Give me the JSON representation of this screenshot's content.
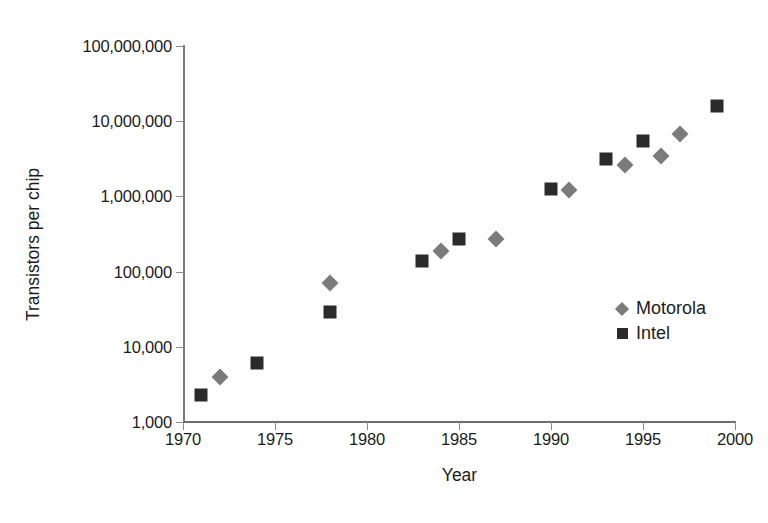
{
  "chart_data": {
    "type": "scatter",
    "title": "",
    "xlabel": "Year",
    "ylabel": "Transistors per chip",
    "xlim": [
      1970,
      2000
    ],
    "ylim": [
      1000,
      100000000
    ],
    "yscale": "log",
    "grid": false,
    "legend_position": "inside-right",
    "xticks": [
      "1970",
      "1975",
      "1980",
      "1985",
      "1990",
      "1995",
      "2000"
    ],
    "xtick_values": [
      1970,
      1975,
      1980,
      1985,
      1990,
      1995,
      2000
    ],
    "yticks": [
      "1,000",
      "10,000",
      "100,000",
      "1,000,000",
      "10,000,000",
      "100,000,000"
    ],
    "ytick_values": [
      1000,
      10000,
      100000,
      1000000,
      10000000,
      100000000
    ],
    "series": [
      {
        "name": "Motorola",
        "marker": "diamond",
        "color": "#7b7b7b",
        "points": [
          {
            "x": 1972,
            "y": 4000
          },
          {
            "x": 1978,
            "y": 70000
          },
          {
            "x": 1984,
            "y": 190000
          },
          {
            "x": 1987,
            "y": 270000
          },
          {
            "x": 1991,
            "y": 1200000
          },
          {
            "x": 1994,
            "y": 2600000
          },
          {
            "x": 1996,
            "y": 3400000
          },
          {
            "x": 1997,
            "y": 6800000
          }
        ]
      },
      {
        "name": "Intel",
        "marker": "square",
        "color": "#2b2b2b",
        "points": [
          {
            "x": 1971,
            "y": 2300
          },
          {
            "x": 1974,
            "y": 6000
          },
          {
            "x": 1978,
            "y": 29000
          },
          {
            "x": 1983,
            "y": 140000
          },
          {
            "x": 1985,
            "y": 275000
          },
          {
            "x": 1990,
            "y": 1250000
          },
          {
            "x": 1993,
            "y": 3100000
          },
          {
            "x": 1995,
            "y": 5500000
          },
          {
            "x": 1999,
            "y": 16000000
          }
        ]
      }
    ]
  },
  "legend": {
    "entries": [
      {
        "label": "Motorola",
        "marker": "diamond",
        "color": "#7b7b7b"
      },
      {
        "label": "Intel",
        "marker": "square",
        "color": "#2b2b2b"
      }
    ]
  },
  "axes": {
    "x_title": "Year",
    "y_title": "Transistors per chip"
  },
  "colors": {
    "axis": "#6d6d6d",
    "text": "#1c1c1c",
    "background": "#ffffff",
    "motorola": "#7b7b7b",
    "intel": "#2b2b2b"
  }
}
